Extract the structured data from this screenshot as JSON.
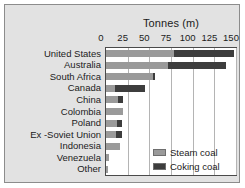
{
  "chart_data": {
    "type": "bar",
    "orientation": "horizontal",
    "stacked": true,
    "title": "Tonnes (m)",
    "xlabel": "Tonnes (m)",
    "ylabel": "",
    "xlim": [
      0,
      150
    ],
    "xticks": [
      0,
      25,
      50,
      75,
      100,
      125,
      150
    ],
    "xtick_labels": [
      "0",
      "25",
      "50",
      "75",
      "100",
      "125",
      "150"
    ],
    "grid": true,
    "legend_position": "bottom-right",
    "categories": [
      "United States",
      "Australia",
      "South Africa",
      "Canada",
      "China",
      "Colombia",
      "Poland",
      "Ex -Soviet Union",
      "Indonesia",
      "Venezuela",
      "Other"
    ],
    "series": [
      {
        "name": "Steam coal",
        "color": "#9a9a9a",
        "values": [
          78,
          72,
          54,
          10,
          14,
          20,
          13,
          12,
          16,
          3,
          2
        ]
      },
      {
        "name": "Coking coal",
        "color": "#3d3d3d",
        "values": [
          70,
          66,
          2,
          35,
          6,
          0,
          5,
          7,
          0,
          0,
          0
        ]
      }
    ],
    "totals": [
      148,
      138,
      56,
      45,
      20,
      20,
      18,
      19,
      16,
      3,
      2
    ]
  },
  "legend": {
    "items": [
      {
        "label": "Steam coal",
        "color": "#9a9a9a"
      },
      {
        "label": "Coking coal",
        "color": "#3d3d3d"
      }
    ]
  },
  "colors": {
    "panel_background": "#e2e2e2",
    "plot_background": "#ffffff",
    "axis": "#4a4a4a",
    "gridline": "#b4b4b4",
    "text": "#1b1b1b",
    "steam_coal": "#9a9a9a",
    "coking_coal": "#3d3d3d"
  }
}
